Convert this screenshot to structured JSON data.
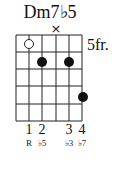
{
  "chord": {
    "name": "Dm7♭5",
    "base_fret_label": "5fr."
  },
  "grid": {
    "strings": 6,
    "frets": 5,
    "string_x": [
      16,
      29,
      42,
      56,
      69,
      82
    ],
    "fret_y": [
      35,
      52,
      69,
      86,
      104,
      121
    ]
  },
  "muted": [
    {
      "string": 4,
      "symbol": "×"
    }
  ],
  "open_markers": [
    {
      "string": 2,
      "fret": 1,
      "type": "open-circle"
    }
  ],
  "dots": [
    {
      "string": 3,
      "fret": 2
    },
    {
      "string": 5,
      "fret": 2
    },
    {
      "string": 6,
      "fret": 4
    }
  ],
  "fingers": [
    {
      "string": 2,
      "label": "1",
      "interval": "R"
    },
    {
      "string": 3,
      "label": "2",
      "interval": "♭5"
    },
    {
      "string": 5,
      "label": "3",
      "interval": "♭3"
    },
    {
      "string": 6,
      "label": "4",
      "interval": "♭7"
    }
  ]
}
